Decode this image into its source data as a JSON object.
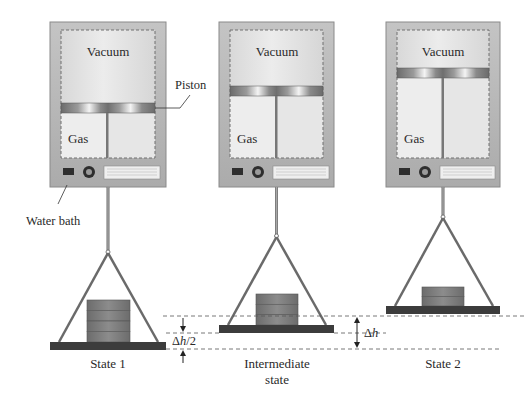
{
  "figure": {
    "type": "thermodynamics-piston-weights-diagram",
    "states": [
      {
        "id": "state1",
        "label": "State 1",
        "label_line2": "",
        "chamber_labels": {
          "vacuum": "Vacuum",
          "gas": "Gas"
        },
        "weight_blocks": 4,
        "piston_y": 103,
        "pan_y": 342,
        "hook_y": 252
      },
      {
        "id": "intermediate",
        "label": "Intermediate",
        "label_line2": "state",
        "chamber_labels": {
          "vacuum": "Vacuum",
          "gas": "Gas"
        },
        "weight_blocks": 3,
        "piston_y": 86,
        "pan_y": 325,
        "hook_y": 236
      },
      {
        "id": "state2",
        "label": "State 2",
        "label_line2": "",
        "chamber_labels": {
          "vacuum": "Vacuum",
          "gas": "Gas"
        },
        "weight_blocks": 2,
        "piston_y": 68,
        "pan_y": 306,
        "hook_y": 217
      }
    ],
    "callouts": {
      "piston": "Piston",
      "water_bath": "Water bath"
    },
    "dimensions": {
      "half_delta": {
        "symbol": "Δ",
        "var": "h",
        "suffix": "/2"
      },
      "full_delta": {
        "symbol": "Δ",
        "var": "h",
        "suffix": ""
      }
    },
    "colors": {
      "housing": "#b9b9b9",
      "housing_border": "#8a8a8a",
      "chamber": "#e3e3e3",
      "piston_dark": "#6f6f6f",
      "piston_light": "#f2f2f2",
      "pan": "#3c3c3c",
      "weight": "#7a7a7a",
      "rope": "#6a6a6a",
      "dash": "#555555"
    }
  }
}
